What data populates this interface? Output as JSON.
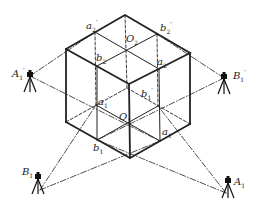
{
  "diagram": {
    "colors": {
      "line": "#222222",
      "background": "#ffffff"
    },
    "labels": {
      "a2p": {
        "base": "a",
        "sub": "2",
        "sup": "′"
      },
      "b2p": {
        "base": "b",
        "sub": "2",
        "sup": "′"
      },
      "O2": {
        "base": "O",
        "sub": "2",
        "sup": ""
      },
      "b2": {
        "base": "b",
        "sub": "2",
        "sup": ""
      },
      "a2": {
        "base": "a",
        "sub": "2",
        "sup": ""
      },
      "A1p": {
        "base": "A",
        "sub": "1",
        "sup": "′"
      },
      "B1p": {
        "base": "B",
        "sub": "1",
        "sup": "′"
      },
      "a1p": {
        "base": "a",
        "sub": "1",
        "sup": "′"
      },
      "b1p": {
        "base": "b",
        "sub": "1",
        "sup": "′"
      },
      "O1": {
        "base": "O",
        "sub": "1",
        "sup": ""
      },
      "a1": {
        "base": "a",
        "sub": "1",
        "sup": ""
      },
      "b1": {
        "base": "b",
        "sub": "1",
        "sup": ""
      },
      "B1": {
        "base": "B",
        "sub": "1",
        "sup": ""
      },
      "A1": {
        "base": "A",
        "sub": "1",
        "sup": ""
      }
    },
    "stations": [
      "A1′",
      "B1′",
      "B1",
      "A1"
    ]
  }
}
